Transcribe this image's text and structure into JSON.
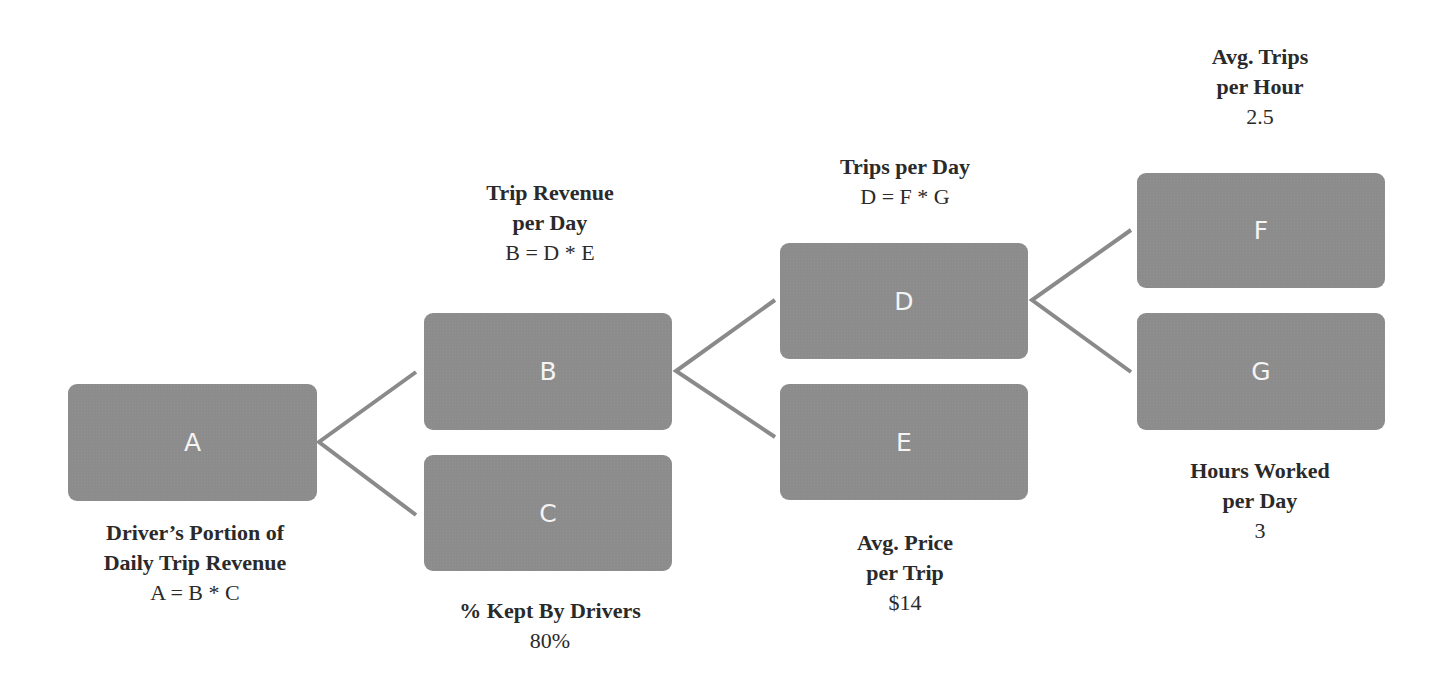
{
  "diagram": {
    "type": "driver-tree",
    "colors": {
      "box": "#8c8c8c",
      "box_text": "#f4f4f4",
      "line": "#8a8a8a",
      "text": "#2a2a2a"
    },
    "nodes": {
      "A": {
        "letter": "A",
        "title_line1": "Driver’s Portion of",
        "title_line2": "Daily Trip Revenue",
        "value": "A = B * C"
      },
      "B": {
        "letter": "B",
        "title_line1": "Trip Revenue",
        "title_line2": "per Day",
        "value": "B = D * E"
      },
      "C": {
        "letter": "C",
        "title_line1": "% Kept By Drivers",
        "value": "80%"
      },
      "D": {
        "letter": "D",
        "title_line1": "Trips per Day",
        "value": "D = F * G"
      },
      "E": {
        "letter": "E",
        "title_line1": "Avg. Price",
        "title_line2": "per Trip",
        "value": "$14"
      },
      "F": {
        "letter": "F",
        "title_line1": "Avg. Trips",
        "title_line2": "per Hour",
        "value": "2.5"
      },
      "G": {
        "letter": "G",
        "title_line1": "Hours Worked",
        "title_line2": "per Day",
        "value": "3"
      }
    },
    "edges": [
      {
        "from": "A",
        "to": "B"
      },
      {
        "from": "A",
        "to": "C"
      },
      {
        "from": "B",
        "to": "D"
      },
      {
        "from": "B",
        "to": "E"
      },
      {
        "from": "D",
        "to": "F"
      },
      {
        "from": "D",
        "to": "G"
      }
    ]
  }
}
